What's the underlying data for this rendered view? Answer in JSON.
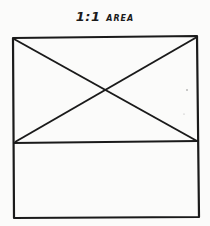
{
  "title": {
    "ratio": "1:1",
    "word": "AREA"
  },
  "diagram": {
    "stroke_color": "#1a1a1a",
    "background": "#fbfbfa",
    "outer_box": {
      "x1": 13,
      "y1": 37,
      "x2": 198,
      "y2": 217
    },
    "divider_y": 142,
    "upper_region": {
      "label": "",
      "has_x_cross": true
    },
    "lower_region": {
      "label": ""
    }
  }
}
